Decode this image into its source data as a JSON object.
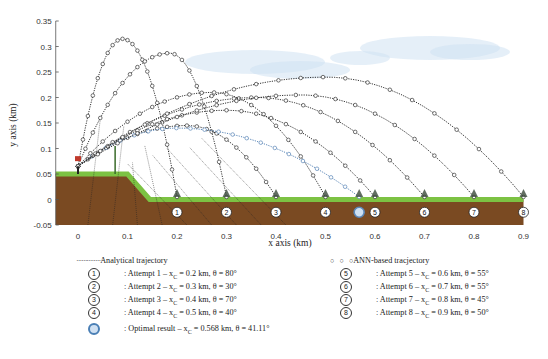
{
  "chart_data": {
    "type": "line",
    "title": "",
    "xlabel": "x axis (km)",
    "ylabel": "y axis (km)",
    "xlim": [
      -0.045,
      0.9
    ],
    "ylim": [
      -0.05,
      0.35
    ],
    "xticks": [
      "0",
      "0.1",
      "0.2",
      "0.3",
      "0.4",
      "0.5",
      "0.6",
      "0.7",
      "0.8",
      "0.9"
    ],
    "yticks": [
      "-0.05",
      "0",
      "0.05",
      "0.1",
      "0.15",
      "0.2",
      "0.25",
      "0.3",
      "0.35"
    ],
    "grid": false,
    "launch_point": {
      "x": 0,
      "y": 0.065
    },
    "terrain": {
      "plateau_height": 0.05,
      "plateau_end_x": 0.1,
      "slope_end_x": 0.145,
      "ground_height": 0.0
    },
    "series": [
      {
        "name": "Attempt 1",
        "marker": "1",
        "xc": 0.2,
        "theta_deg": 80,
        "apex": [
          0.09,
          0.315
        ],
        "color": "#333333"
      },
      {
        "name": "Attempt 2",
        "marker": "2",
        "xc": 0.3,
        "theta_deg": 30,
        "apex": [
          0.185,
          0.287
        ],
        "color": "#333333"
      },
      {
        "name": "Attempt 3",
        "marker": "3",
        "xc": 0.4,
        "theta_deg": 70,
        "apex": [
          0.22,
          0.145
        ],
        "color": "#333333"
      },
      {
        "name": "Attempt 4",
        "marker": "4",
        "xc": 0.5,
        "theta_deg": 40,
        "apex": [
          0.27,
          0.21
        ],
        "color": "#333333"
      },
      {
        "name": "Optimal result",
        "marker": "O",
        "xc": 0.568,
        "theta_deg": 41.11,
        "apex": [
          0.2,
          0.14
        ],
        "color": "#5b87b8"
      },
      {
        "name": "Attempt 5",
        "marker": "5",
        "xc": 0.6,
        "theta_deg": 55,
        "apex": [
          0.3,
          0.175
        ],
        "color": "#333333"
      },
      {
        "name": "Attempt 6",
        "marker": "6",
        "xc": 0.7,
        "theta_deg": 55,
        "apex": [
          0.36,
          0.2
        ],
        "color": "#333333"
      },
      {
        "name": "Attempt 7",
        "marker": "7",
        "xc": 0.8,
        "theta_deg": 45,
        "apex": [
          0.45,
          0.205
        ],
        "color": "#333333"
      },
      {
        "name": "Attempt 8",
        "marker": "8",
        "xc": 0.9,
        "theta_deg": 50,
        "apex": [
          0.5,
          0.24
        ],
        "color": "#333333"
      }
    ],
    "legend": {
      "analytical": "Analytical trajectory",
      "ann": "ANN-based tracjectory",
      "left": [
        {
          "marker": "1",
          "text": ": Attempt 1 – x",
          "sub": "C",
          "rest": " = 0.2 km,  θ = 80°"
        },
        {
          "marker": "2",
          "text": ": Attempt 2 – x",
          "sub": "C",
          "rest": " = 0.3 km,  θ = 30°"
        },
        {
          "marker": "3",
          "text": ": Attempt 3 – x",
          "sub": "C",
          "rest": " = 0.4 km,  θ = 70°"
        },
        {
          "marker": "4",
          "text": ": Attempt 4 – x",
          "sub": "C",
          "rest": " = 0.5 km,  θ = 40°"
        },
        {
          "marker": "O",
          "text": ": Optimal result – x",
          "sub": "C",
          "rest": " = 0.568 km,  θ = 41.11°"
        }
      ],
      "right": [
        {
          "marker": "5",
          "text": ": Attempt 5 – x",
          "sub": "C",
          "rest": " = 0.6 km,  θ = 55°"
        },
        {
          "marker": "6",
          "text": ": Attempt 6 – x",
          "sub": "C",
          "rest": " = 0.7 km,  θ = 55°"
        },
        {
          "marker": "7",
          "text": ": Attempt 7 – x",
          "sub": "C",
          "rest": " = 0.8 km,  θ = 45°"
        },
        {
          "marker": "8",
          "text": ": Attempt 8 – x",
          "sub": "C",
          "rest": " = 0.9 km,  θ = 50°"
        }
      ]
    },
    "colors": {
      "ground": "#7a4a22",
      "grass": "#7cc243",
      "optimal": "#5b87b8",
      "sky_cloud": "#cfe2f3"
    }
  }
}
